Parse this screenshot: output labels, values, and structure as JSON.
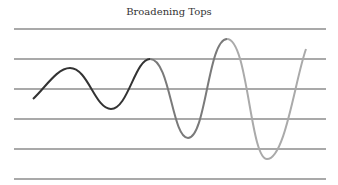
{
  "title": "Broadening Tops",
  "gridlines_y": [
    29,
    59,
    89,
    119,
    149,
    179
  ],
  "colors": {
    "line": "#555555",
    "curve_dark": "#333333",
    "curve_mid": "#777777",
    "curve_light": "#aaaaaa"
  },
  "curve_points": [
    [
      33,
      99
    ],
    [
      70,
      68
    ],
    [
      111,
      109
    ],
    [
      150,
      59
    ],
    [
      188,
      138
    ],
    [
      227,
      39
    ],
    [
      267,
      159
    ],
    [
      306,
      49
    ]
  ]
}
